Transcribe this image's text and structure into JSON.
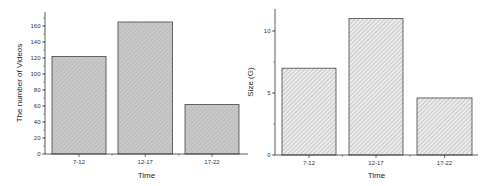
{
  "chart_data": [
    {
      "type": "bar",
      "title": "",
      "xlabel": "Time",
      "ylabel": "The number of Videos",
      "categories": [
        "7-12",
        "12-17",
        "17-22"
      ],
      "values": [
        122,
        165,
        62
      ],
      "ylim": [
        0,
        180
      ],
      "yticks": [
        0,
        20,
        40,
        60,
        80,
        100,
        120,
        140,
        160
      ],
      "grid": false,
      "fill": "#c4c4c4",
      "pattern": "fine-crosshatch"
    },
    {
      "type": "bar",
      "title": "",
      "xlabel": "Time",
      "ylabel": "Size (G)",
      "categories": [
        "7-12",
        "12-17",
        "17-22"
      ],
      "values": [
        7.0,
        11.0,
        4.6
      ],
      "ylim": [
        0,
        11.8
      ],
      "yticks": [
        0,
        5,
        10
      ],
      "grid": false,
      "fill": "#e6e6e6",
      "pattern": "diagonal-hatch"
    }
  ]
}
